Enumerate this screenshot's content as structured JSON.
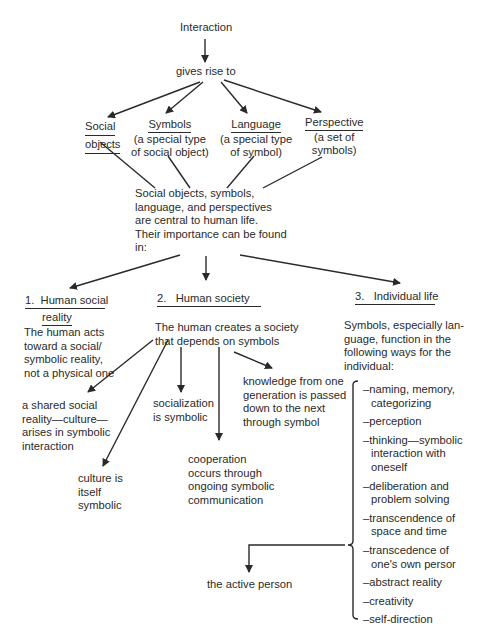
{
  "diagram": {
    "root": "Interaction",
    "gives_rise": "gives rise to",
    "concepts": [
      {
        "title_lines": [
          "Social",
          "objects"
        ],
        "desc_lines": []
      },
      {
        "title_lines": [
          "Symbols"
        ],
        "desc_lines": [
          "(a special type",
          "of social object)"
        ]
      },
      {
        "title_lines": [
          "Language"
        ],
        "desc_lines": [
          "(a special type",
          "of symbol)"
        ]
      },
      {
        "title_lines": [
          "Perspective"
        ],
        "desc_lines": [
          "(a set of",
          "symbols)"
        ]
      }
    ],
    "central": [
      "Social objects, symbols,",
      "language, and perspectives",
      "are central to human life.",
      "Their importance can be found",
      "in:"
    ],
    "sections": [
      {
        "num": "1.",
        "title_lines": [
          "Human social",
          "reality"
        ],
        "desc": [
          "The human acts",
          "toward a social/",
          "symbolic reality,",
          "not a physical one"
        ]
      },
      {
        "num": "2.",
        "title_lines": [
          "Human society"
        ],
        "desc": [
          "The human creates a society",
          "that depends on symbols"
        ]
      },
      {
        "num": "3.",
        "title_lines": [
          "Individual life"
        ],
        "desc": [
          "Symbols, especially lan-",
          "guage, function in the",
          "following ways for the",
          "individual:"
        ]
      }
    ],
    "society_outcomes": [
      [
        "a shared social",
        "reality—culture—",
        "arises in symbolic",
        "interaction"
      ],
      [
        "culture is",
        "itself",
        "symbolic"
      ],
      [
        "socialization",
        "is symbolic"
      ],
      [
        "cooperation",
        "occurs through",
        "ongoing symbolic",
        "communication"
      ],
      [
        "knowledge from one",
        "generation is passed",
        "down to the next",
        "through symbol"
      ]
    ],
    "individual_functions": [
      [
        "–naming, memory,",
        "categorizing"
      ],
      [
        "–perception"
      ],
      [
        "–thinking—symbolic",
        "interaction with",
        "oneself"
      ],
      [
        "–deliberation and",
        "problem solving"
      ],
      [
        "–transcendence of",
        "space and time"
      ],
      [
        "–transcedence of",
        "one's own persor"
      ],
      [
        "–abstract reality"
      ],
      [
        "–creativity"
      ],
      [
        "–self-direction"
      ]
    ],
    "result": "the active person"
  },
  "colors": {
    "ink": "#2a2a2a",
    "background": "#ffffff"
  }
}
